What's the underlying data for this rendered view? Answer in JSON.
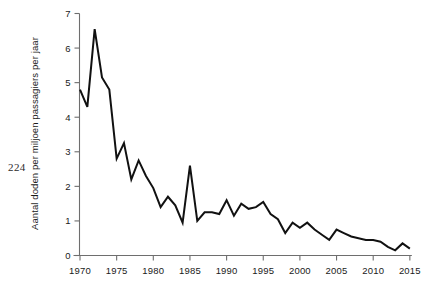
{
  "page": {
    "number": "224"
  },
  "chart_data": {
    "type": "line",
    "title": "",
    "xlabel": "",
    "ylabel": "Aantal doden per miljoen passagiers per jaar",
    "xlim": [
      1969,
      2015.5
    ],
    "ylim": [
      0,
      7
    ],
    "grid": false,
    "legend": null,
    "x_ticks": [
      1970,
      1975,
      1980,
      1985,
      1990,
      1995,
      2000,
      2005,
      2010,
      2015
    ],
    "x_tick_labels": [
      "1970",
      "1975",
      "1980",
      "1985",
      "1990",
      "1995",
      "2000",
      "2005",
      "2010",
      "2015"
    ],
    "y_ticks": [
      0,
      1,
      2,
      3,
      4,
      5,
      6,
      7
    ],
    "y_tick_labels": [
      "0",
      "1",
      "2",
      "3",
      "4",
      "5",
      "6",
      "7"
    ],
    "series": [
      {
        "name": "Aantal doden per miljoen passagiers per jaar",
        "color": "#111111",
        "x": [
          1970,
          1971,
          1972,
          1973,
          1974,
          1975,
          1976,
          1977,
          1978,
          1979,
          1980,
          1981,
          1982,
          1983,
          1984,
          1985,
          1986,
          1987,
          1988,
          1989,
          1990,
          1991,
          1992,
          1993,
          1994,
          1995,
          1996,
          1997,
          1998,
          1999,
          2000,
          2001,
          2002,
          2003,
          2004,
          2005,
          2006,
          2007,
          2008,
          2009,
          2010,
          2011,
          2012,
          2013,
          2014,
          2015
        ],
        "values": [
          4.8,
          4.3,
          6.55,
          5.15,
          4.8,
          2.8,
          3.25,
          2.2,
          2.75,
          2.3,
          1.95,
          1.4,
          1.7,
          1.45,
          0.95,
          2.6,
          1.0,
          1.25,
          1.25,
          1.2,
          1.6,
          1.15,
          1.5,
          1.35,
          1.4,
          1.55,
          1.2,
          1.05,
          0.65,
          0.95,
          0.8,
          0.95,
          0.75,
          0.6,
          0.45,
          0.75,
          0.65,
          0.55,
          0.5,
          0.45,
          0.45,
          0.4,
          0.25,
          0.15,
          0.35,
          0.2
        ]
      }
    ]
  }
}
